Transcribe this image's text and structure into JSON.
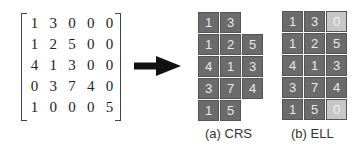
{
  "matrix": {
    "rows": [
      [
        "1",
        "3",
        "0",
        "0",
        "0"
      ],
      [
        "1",
        "2",
        "5",
        "0",
        "0"
      ],
      [
        "4",
        "1",
        "3",
        "0",
        "0"
      ],
      [
        "0",
        "3",
        "7",
        "4",
        "0"
      ],
      [
        "1",
        "0",
        "0",
        "0",
        "5"
      ]
    ]
  },
  "crs": {
    "caption": "(a) CRS",
    "rows": [
      [
        "1",
        "3"
      ],
      [
        "1",
        "2",
        "5"
      ],
      [
        "4",
        "1",
        "3"
      ],
      [
        "3",
        "7",
        "4"
      ],
      [
        "1",
        "5"
      ]
    ]
  },
  "ell": {
    "caption": "(b) ELL",
    "rows": [
      [
        "1",
        "3",
        "0"
      ],
      [
        "1",
        "2",
        "5"
      ],
      [
        "4",
        "1",
        "3"
      ],
      [
        "3",
        "7",
        "4"
      ],
      [
        "1",
        "5",
        "0"
      ]
    ],
    "padded_cells": [
      [
        0,
        2
      ],
      [
        4,
        2
      ]
    ]
  },
  "colors": {
    "cell": "#6b6b6b",
    "padding_cell": "#c7c7c7",
    "arrow": "#111111"
  }
}
